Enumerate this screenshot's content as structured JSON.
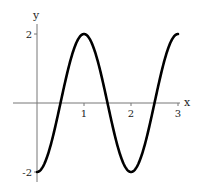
{
  "chart_data": {
    "type": "line",
    "title": "",
    "xlabel": "x",
    "ylabel": "y",
    "xlim": [
      0,
      3
    ],
    "ylim": [
      -2,
      2
    ],
    "x_ticks": [
      1,
      2,
      3
    ],
    "x_tick_labels": [
      "1",
      "2",
      "3"
    ],
    "y_ticks": [
      -2,
      2
    ],
    "y_tick_labels": [
      "-2",
      "2"
    ],
    "grid": false,
    "legend": null,
    "series": [
      {
        "name": "y = -2cos(πx)",
        "x": [
          0,
          0.25,
          0.5,
          0.75,
          1,
          1.25,
          1.5,
          1.75,
          2,
          2.25,
          2.5,
          2.75,
          3
        ],
        "y": [
          -2,
          -1.41,
          0,
          1.41,
          2,
          1.41,
          0,
          -1.41,
          -2,
          -1.41,
          0,
          1.41,
          2
        ],
        "color": "#000000"
      }
    ]
  },
  "colors": {
    "curve": "#000000",
    "axes": "#777777",
    "text": "#222222"
  }
}
